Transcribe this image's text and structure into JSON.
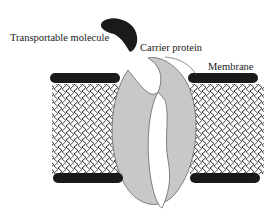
{
  "diagram": {
    "type": "carrier-protein-membrane-transport",
    "labels": {
      "molecule": "Transportable molecule",
      "protein": "Carrier protein",
      "membrane": "Membrane"
    },
    "colors": {
      "molecule": "#1a1a1a",
      "protein_fill": "#c8c8c8",
      "protein_channel": "#ffffff",
      "lipid_heads": "#1a1a1a",
      "lipid_tails": "#2a2a2a",
      "background": "#ffffff"
    }
  }
}
